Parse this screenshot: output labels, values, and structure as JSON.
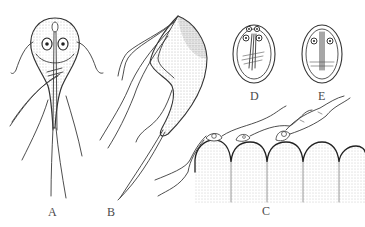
{
  "figure": {
    "panels": [
      {
        "id": "A",
        "label": "A",
        "subject": "trophozoite-ventral-view"
      },
      {
        "id": "B",
        "label": "B",
        "subject": "trophozoite-lateral-view"
      },
      {
        "id": "C",
        "label": "C",
        "subject": "trophozoites-attached-to-intestinal-epithelium"
      },
      {
        "id": "D",
        "label": "D",
        "subject": "cyst-four-nuclei"
      },
      {
        "id": "E",
        "label": "E",
        "subject": "cyst-two-nuclei"
      }
    ],
    "colors": {
      "background": "#ffffff",
      "ink": "#3a3a3a",
      "label": "#4a4a4a"
    }
  }
}
